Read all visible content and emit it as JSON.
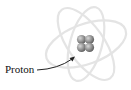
{
  "diagram": {
    "type": "atom-illustration",
    "labels": [
      {
        "text": "Proton",
        "points_to": "nucleus"
      }
    ],
    "nucleus": {
      "particles": 4,
      "color": "#8a8a8a"
    },
    "orbits": {
      "count": 3,
      "color": "#e6e6e6"
    },
    "arrow_color": "#222222"
  }
}
